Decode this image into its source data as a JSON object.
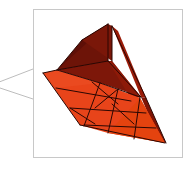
{
  "figure": {
    "kind": "3d-mesh-callout-inset",
    "title": "Triangulated 3D surface mesh inset",
    "background_color": "#ffffff",
    "canvas": {
      "width": 194,
      "height": 169
    }
  },
  "frame": {
    "label": "inset panel border",
    "x": 33,
    "y": 9,
    "width": 149,
    "height": 148,
    "stroke_color": "#c8c8c8",
    "stroke_width": 1,
    "fill_color": "#ffffff"
  },
  "callout": {
    "label": "zoom leader wedge",
    "stroke_color": "#bdbdbd",
    "stroke_width": 1,
    "fill_color": "#ffffff",
    "upper_line": {
      "x1": -6,
      "y1": 84,
      "x2": 33,
      "y2": 69
    },
    "lower_line": {
      "x1": -6,
      "y1": 86,
      "x2": 33,
      "y2": 99
    },
    "apex": {
      "x": -6,
      "y": 85
    }
  },
  "mesh": {
    "label": "triangulated trough surface",
    "palette": {
      "floor_orange": "#e8441a",
      "floor_orange_alt": "#ea4a20",
      "floor_orange_dark": "#d8400f",
      "wall_dark_maroon": "#6b1209",
      "wall_mid_maroon": "#7d1709",
      "wall_deep_maroon": "#4e0c05",
      "side_red": "#9a1b08",
      "side_red_dark": "#751205",
      "edge_line": "#2a0703"
    },
    "faces": [
      {
        "name": "back-wall-left",
        "points": "57,70 82,40 108,24 108,61",
        "fill": "#5e0f07"
      },
      {
        "name": "back-wall-right",
        "points": "57,70 108,24 108,61 112,61",
        "fill": "#6d1408"
      },
      {
        "name": "back-wall-upper-panel",
        "points": "82,40 108,24 112,26 112,61",
        "fill": "#7a1709"
      },
      {
        "name": "inner-wall-slope",
        "points": "57,70 108,61 112,61 140,96 100,83",
        "fill": "#7d1709"
      },
      {
        "name": "inner-wall-right",
        "points": "108,61 112,61 141,97 131,99",
        "fill": "#8d1a08"
      },
      {
        "name": "right-outer-band",
        "points": "112,26 118,31 146,98 141,97",
        "fill": "#9a1b08"
      },
      {
        "name": "right-outer-band-lower",
        "points": "141,97 146,98 166,143 159,140",
        "fill": "#7e1405"
      },
      {
        "name": "floor-main",
        "points": "43,73 100,83 140,98 165,143 108,133 80,125",
        "fill": "#e8441a"
      },
      {
        "name": "floor-left-wedge",
        "points": "43,73 57,70 100,83 56,88",
        "fill": "#ea4a20"
      },
      {
        "name": "floor-bottom-right",
        "points": "108,133 165,143 140,98",
        "fill": "#e4430f"
      }
    ],
    "edges": [
      {
        "name": "floor-grid-a",
        "x1": 56,
        "y1": 88,
        "x2": 131,
        "y2": 101
      },
      {
        "name": "floor-grid-b",
        "x1": 70,
        "y1": 108,
        "x2": 146,
        "y2": 113
      },
      {
        "name": "floor-grid-c",
        "x1": 84,
        "y1": 125,
        "x2": 156,
        "y2": 128
      },
      {
        "name": "floor-grid-d",
        "x1": 100,
        "y1": 83,
        "x2": 84,
        "y2": 126
      },
      {
        "name": "floor-grid-e",
        "x1": 118,
        "y1": 89,
        "x2": 108,
        "y2": 133
      },
      {
        "name": "floor-grid-f",
        "x1": 140,
        "y1": 97,
        "x2": 134,
        "y2": 139
      },
      {
        "name": "floor-diag-a",
        "x1": 92,
        "y1": 82,
        "x2": 118,
        "y2": 104
      },
      {
        "name": "floor-diag-b",
        "x1": 118,
        "y1": 89,
        "x2": 95,
        "y2": 108
      },
      {
        "name": "floor-diag-c",
        "x1": 70,
        "y1": 108,
        "x2": 95,
        "y2": 124
      },
      {
        "name": "floor-diag-d",
        "x1": 112,
        "y1": 104,
        "x2": 134,
        "y2": 124
      },
      {
        "name": "wall-edge-apex",
        "x1": 82,
        "y1": 40,
        "x2": 108,
        "y2": 24
      },
      {
        "name": "wall-edge-vertical",
        "x1": 112,
        "y1": 26,
        "x2": 112,
        "y2": 61
      },
      {
        "name": "wall-edge-left",
        "x1": 82,
        "y1": 40,
        "x2": 57,
        "y2": 70
      },
      {
        "name": "wall-edge-base",
        "x1": 57,
        "y1": 70,
        "x2": 100,
        "y2": 83
      },
      {
        "name": "wall-edge-base-right",
        "x1": 100,
        "y1": 83,
        "x2": 140,
        "y2": 97
      },
      {
        "name": "wall-inner-vert",
        "x1": 108,
        "y1": 24,
        "x2": 108,
        "y2": 61
      },
      {
        "name": "wall-inner-diag",
        "x1": 108,
        "y1": 61,
        "x2": 57,
        "y2": 70
      },
      {
        "name": "wall-inner-diag2",
        "x1": 108,
        "y1": 61,
        "x2": 141,
        "y2": 97
      },
      {
        "name": "right-band-edge",
        "x1": 112,
        "y1": 26,
        "x2": 146,
        "y2": 98
      },
      {
        "name": "right-band-edge2",
        "x1": 146,
        "y1": 98,
        "x2": 166,
        "y2": 143
      },
      {
        "name": "floor-outline-left",
        "x1": 43,
        "y1": 73,
        "x2": 80,
        "y2": 125
      },
      {
        "name": "floor-outline-bottom",
        "x1": 80,
        "y1": 125,
        "x2": 165,
        "y2": 143
      },
      {
        "name": "floor-outline-topleft",
        "x1": 43,
        "y1": 73,
        "x2": 57,
        "y2": 70
      }
    ]
  }
}
